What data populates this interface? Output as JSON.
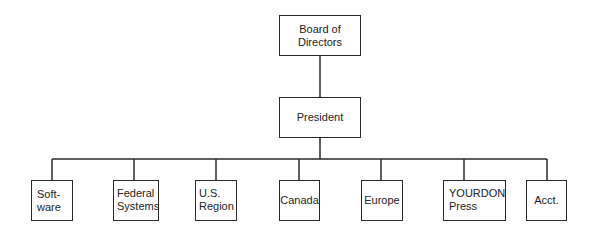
{
  "diagram": {
    "type": "org-chart",
    "root": {
      "label": "Board of\nDirectors"
    },
    "level1": {
      "label": "President"
    },
    "departments": [
      {
        "label": "Soft-\nware"
      },
      {
        "label": "Federal\nSystems"
      },
      {
        "label": "U.S.\nRegion"
      },
      {
        "label": "Canada"
      },
      {
        "label": "Europe"
      },
      {
        "label": "YOURDON\nPress"
      },
      {
        "label": "Acct."
      }
    ],
    "line_color": "#2a2a2a"
  }
}
